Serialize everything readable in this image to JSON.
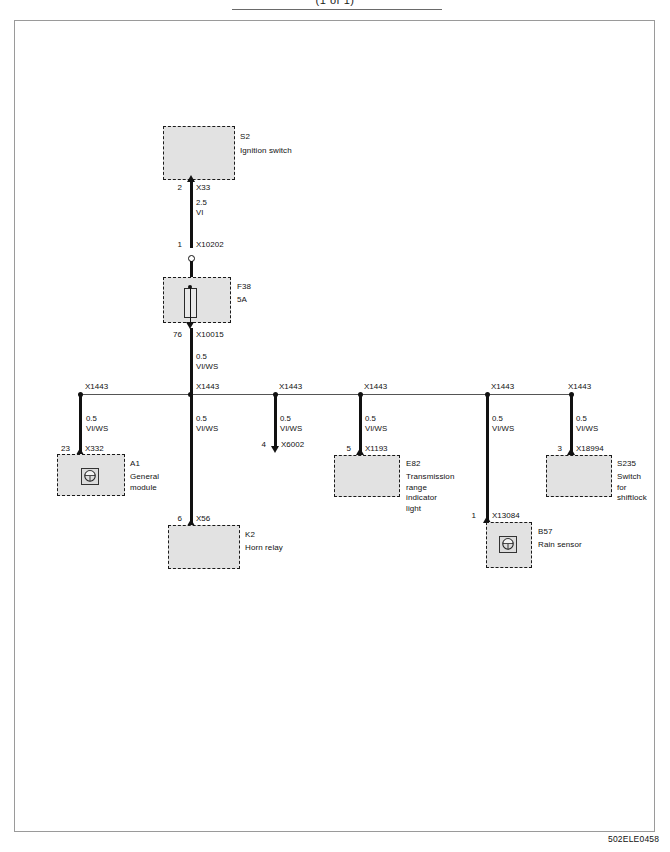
{
  "header": {
    "title": "(1 of 1)"
  },
  "footer": {
    "code": "502ELE0458"
  },
  "components": [
    {
      "id": "S2",
      "name": "Ignition switch",
      "pin": "2",
      "connector": "X33"
    },
    {
      "id": "F38",
      "name": "5A",
      "pin_in": "1",
      "connector_in": "X10202",
      "pin_out": "76",
      "connector_out": "X10015"
    },
    {
      "id": "A1",
      "name": "General\nmodule",
      "pin": "23",
      "connector": "X332",
      "icon": "round-connector-icon"
    },
    {
      "id": "K2",
      "name": "Horn relay",
      "pin": "6",
      "connector": "X56"
    },
    {
      "id": "E82",
      "name": "Transmission\nrange\nindicator\nlight",
      "pin": "5",
      "connector": "X1193"
    },
    {
      "id": "B57",
      "name": "Rain sensor",
      "pin": "1",
      "connector": "X13084",
      "icon": "round-connector-icon"
    },
    {
      "id": "S235",
      "name": "Switch\nfor\nshiftlock",
      "pin": "3",
      "connector": "X18994"
    }
  ],
  "open_branch": {
    "pin": "4",
    "connector": "X6002"
  },
  "wires": {
    "supply": {
      "gauge": "2.5",
      "color_code": "VI"
    },
    "branch": {
      "gauge": "0.5",
      "color_code": "VI/WS"
    }
  },
  "bus": {
    "splice_label": "X1443",
    "splice_count": 6
  }
}
